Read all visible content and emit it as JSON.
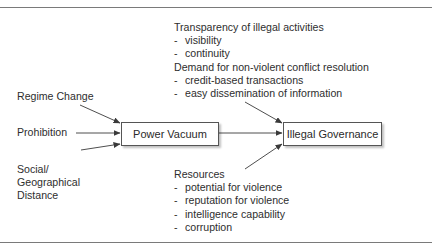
{
  "diagram": {
    "nodes": {
      "power_vacuum": "Power Vacuum",
      "illegal_governance": "Illegal Governance"
    },
    "inputs_left": {
      "regime_change": "Regime Change",
      "prohibition": "Prohibition",
      "social_line1": "Social/",
      "social_line2": "Geographical",
      "social_line3": "Distance"
    },
    "top_block": {
      "heading1": "Transparency of illegal activities",
      "items1": [
        "visibility",
        "continuity"
      ],
      "heading2": "Demand for non-violent conflict resolution",
      "items2": [
        "credit-based transactions",
        "easy dissemination of information"
      ]
    },
    "bottom_block": {
      "heading": "Resources",
      "items": [
        "potential for violence",
        "reputation for violence",
        "intelligence capability",
        "corruption"
      ]
    },
    "bullet_dash": "-",
    "colors": {
      "line": "#3a3a3a",
      "rule": "#7a7a7a",
      "text": "#2e2e2e"
    }
  }
}
